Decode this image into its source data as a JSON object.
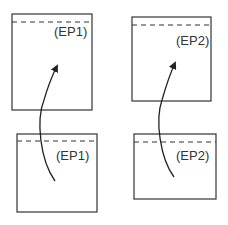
{
  "diagram": {
    "boxes": [
      {
        "id": "top-left",
        "label": "(EP1)"
      },
      {
        "id": "top-right",
        "label": "(EP2)"
      },
      {
        "id": "bottom-left",
        "label": "(EP1)"
      },
      {
        "id": "bottom-right",
        "label": "(EP2)"
      }
    ],
    "arrows": [
      {
        "from": "bottom-left",
        "to": "top-left"
      },
      {
        "from": "bottom-right",
        "to": "top-right"
      }
    ],
    "colors": {
      "stroke": "#333333",
      "background": "#ffffff"
    }
  }
}
